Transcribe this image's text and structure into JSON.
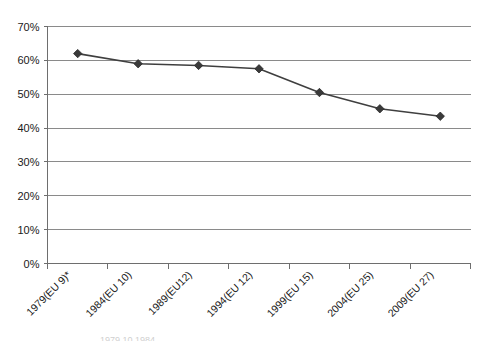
{
  "chart_data": {
    "type": "line",
    "title": "",
    "subtitle": "",
    "xlabel": "",
    "ylabel": "",
    "categories": [
      "1979(EU 9)*",
      "1984(EU 10)",
      "1989(EU12)",
      "1994(EU 12)",
      "1999(EU 15)",
      "2004(EU 25)",
      "2009(EU 27)"
    ],
    "values": [
      62,
      59,
      58.5,
      57.5,
      50.5,
      45.7,
      43.5
    ],
    "value_labels": [
      "62%",
      "59%",
      "58.5%",
      "57.5%",
      "50.5%",
      "45.7%",
      "43.5%"
    ],
    "ylim": [
      0,
      70
    ],
    "ytick_values": [
      0,
      10,
      20,
      30,
      40,
      50,
      60,
      70
    ],
    "ytick_labels": [
      "0%",
      "10%",
      "20%",
      "30%",
      "40%",
      "50%",
      "60%",
      "70%"
    ],
    "grid": "horizontal",
    "legend": "none",
    "series": [
      {
        "name": "Turnout",
        "values": [
          62,
          59,
          58.5,
          57.5,
          50.5,
          45.7,
          43.5
        ],
        "line_color": "#3f3f3f",
        "marker": "diamond",
        "marker_color": "#3a3a3a"
      }
    ],
    "xlabel_rotation": -45,
    "colors": {
      "gridline": "#8a8a8a",
      "axis": "#6e6e6e",
      "line": "#3f3f3f",
      "marker": "#3a3a3a",
      "background": "#ffffff",
      "text": "#1a1a1a"
    }
  },
  "footnote": {
    "sliver_text": "1979  10    1984"
  }
}
